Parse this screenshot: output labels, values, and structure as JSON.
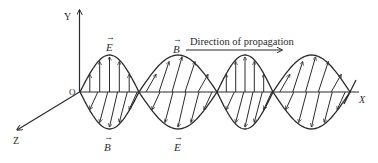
{
  "figure": {
    "colors": {
      "line": "#2b2b2b",
      "background": "#ffffff"
    }
  },
  "axes": {
    "origin_label": "O",
    "x_label": "X",
    "y_label": "Y",
    "z_label": "Z"
  },
  "labels": {
    "e_top": "E",
    "b_top": "B",
    "b_bottom": "B",
    "e_bottom": "E",
    "vector_arrow": "→"
  },
  "propagation": {
    "text": "Direction of propagation"
  },
  "lobes": [
    {
      "start_x": 80,
      "end_x": 139,
      "upper_field": "E",
      "upper_style": "vertical",
      "lower_field": "B",
      "lower_style": "slanted"
    },
    {
      "start_x": 139,
      "end_x": 217,
      "upper_field": "B",
      "upper_style": "slanted",
      "lower_field": "E",
      "lower_style": "slanted"
    },
    {
      "start_x": 217,
      "end_x": 273,
      "upper_field": "E",
      "upper_style": "vertical",
      "lower_field": "B",
      "lower_style": "slanted"
    },
    {
      "start_x": 273,
      "end_x": 350,
      "upper_field": "B",
      "upper_style": "slanted",
      "lower_field": "E",
      "lower_style": "slanted"
    }
  ]
}
